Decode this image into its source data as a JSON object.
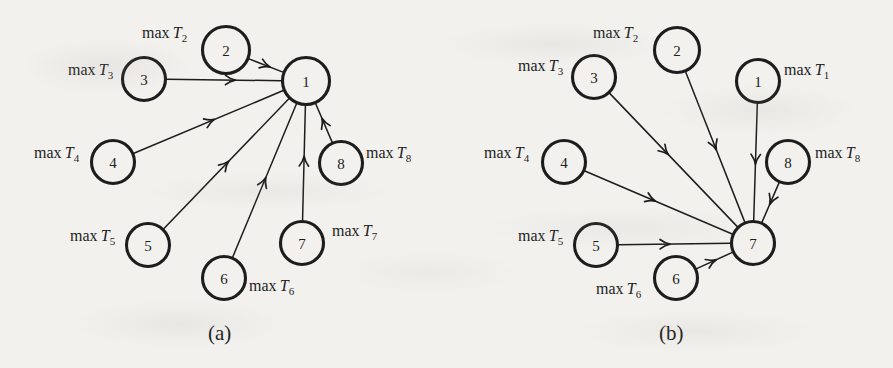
{
  "figure": {
    "panels": [
      {
        "id": "panel-a",
        "caption": "(a)",
        "caption_x": 208,
        "caption_y": 321,
        "hub": "1",
        "nodes": [
          {
            "id": "1",
            "label": "1",
            "cx": 306,
            "cy": 81,
            "r": 23.5
          },
          {
            "id": "2",
            "label": "2",
            "cx": 226,
            "cy": 50,
            "r": 23.5
          },
          {
            "id": "3",
            "label": "3",
            "cx": 144,
            "cy": 79,
            "r": 21.5
          },
          {
            "id": "4",
            "label": "4",
            "cx": 113,
            "cy": 162,
            "r": 21.5
          },
          {
            "id": "5",
            "label": "5",
            "cx": 148,
            "cy": 245,
            "r": 21.5
          },
          {
            "id": "6",
            "label": "6",
            "cx": 224,
            "cy": 278,
            "r": 21.5
          },
          {
            "id": "7",
            "label": "7",
            "cx": 302,
            "cy": 243,
            "r": 21.5
          },
          {
            "id": "8",
            "label": "8",
            "cx": 341,
            "cy": 163,
            "r": 21.5
          }
        ],
        "edges": [
          {
            "from": "2",
            "to": "1",
            "arrow_t": 0.62
          },
          {
            "from": "3",
            "to": "1",
            "arrow_t": 0.6
          },
          {
            "from": "4",
            "to": "1",
            "arrow_t": 0.54
          },
          {
            "from": "5",
            "to": "1",
            "arrow_t": 0.52
          },
          {
            "from": "6",
            "to": "1",
            "arrow_t": 0.52
          },
          {
            "from": "7",
            "to": "1",
            "arrow_t": 0.56
          },
          {
            "from": "8",
            "to": "1",
            "arrow_t": 0.62
          }
        ],
        "labels": [
          {
            "name": "label-max-T2",
            "text": "max",
            "sub": "2",
            "x": 142,
            "y": 25
          },
          {
            "name": "label-max-T3",
            "text": "max",
            "sub": "3",
            "x": 68,
            "y": 62
          },
          {
            "name": "label-max-T4",
            "text": "max",
            "sub": "4",
            "x": 34,
            "y": 145
          },
          {
            "name": "label-max-T5",
            "text": "max",
            "sub": "5",
            "x": 70,
            "y": 228
          },
          {
            "name": "label-max-T6",
            "text": "max",
            "sub": "6",
            "x": 249,
            "y": 278
          },
          {
            "name": "label-max-T7",
            "text": "max",
            "sub": "7",
            "x": 332,
            "y": 223
          },
          {
            "name": "label-max-T8",
            "text": "max",
            "sub": "8",
            "x": 366,
            "y": 145
          }
        ]
      },
      {
        "id": "panel-b",
        "caption": "(b)",
        "caption_x": 659,
        "caption_y": 321,
        "hub": "7",
        "nodes": [
          {
            "id": "1",
            "label": "1",
            "cx": 758,
            "cy": 81,
            "r": 21.5
          },
          {
            "id": "2",
            "label": "2",
            "cx": 677,
            "cy": 50,
            "r": 22.5
          },
          {
            "id": "3",
            "label": "3",
            "cx": 594,
            "cy": 77,
            "r": 21.5
          },
          {
            "id": "4",
            "label": "4",
            "cx": 564,
            "cy": 162,
            "r": 21.5
          },
          {
            "id": "5",
            "label": "5",
            "cx": 596,
            "cy": 245,
            "r": 21.5
          },
          {
            "id": "6",
            "label": "6",
            "cx": 676,
            "cy": 278,
            "r": 21.5
          },
          {
            "id": "7",
            "label": "7",
            "cx": 753,
            "cy": 243,
            "r": 21.5
          },
          {
            "id": "8",
            "label": "8",
            "cx": 788,
            "cy": 162,
            "r": 21.5
          }
        ],
        "edges": [
          {
            "from": "1",
            "to": "7",
            "arrow_t": 0.52
          },
          {
            "from": "2",
            "to": "7",
            "arrow_t": 0.52
          },
          {
            "from": "3",
            "to": "7",
            "arrow_t": 0.46
          },
          {
            "from": "4",
            "to": "7",
            "arrow_t": 0.48
          },
          {
            "from": "5",
            "to": "7",
            "arrow_t": 0.46
          },
          {
            "from": "6",
            "to": "7",
            "arrow_t": 0.55
          },
          {
            "from": "8",
            "to": "7",
            "arrow_t": 0.55
          }
        ],
        "labels": [
          {
            "name": "label-max-T1",
            "text": "max",
            "sub": "1",
            "x": 784,
            "y": 62
          },
          {
            "name": "label-max-T2",
            "text": "max",
            "sub": "2",
            "x": 593,
            "y": 25
          },
          {
            "name": "label-max-T3",
            "text": "max",
            "sub": "3",
            "x": 518,
            "y": 58
          },
          {
            "name": "label-max-T4",
            "text": "max",
            "sub": "4",
            "x": 484,
            "y": 145
          },
          {
            "name": "label-max-T5",
            "text": "max",
            "sub": "5",
            "x": 518,
            "y": 228
          },
          {
            "name": "label-max-T6",
            "text": "max",
            "sub": "6",
            "x": 596,
            "y": 281
          },
          {
            "name": "label-max-T8",
            "text": "max",
            "sub": "8",
            "x": 815,
            "y": 145
          }
        ]
      }
    ],
    "symbol": {
      "max_word": "max",
      "variable": "T"
    },
    "colors": {
      "ink": "#1d1d1d",
      "paper": "#f2f1ee"
    }
  }
}
